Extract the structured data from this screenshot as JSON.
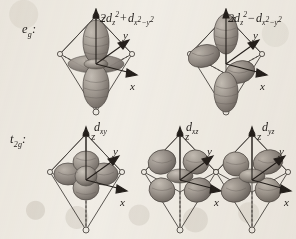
{
  "figure": {
    "background_color": "#f2efe9",
    "ink_color": "#231f1c",
    "lobe_fill": "#8e8781",
    "lobe_fill_light": "#b4aea6",
    "cage_line": "#4a4541"
  },
  "rows": [
    {
      "set_label": "e",
      "set_sub": "g",
      "set_colon": ":",
      "cells": [
        {
          "name": "2d_z2_plus_d_x2-y2",
          "formula_plain": "2dz2 + dx2-y2",
          "lead": "2d",
          "lead_sub": "z",
          "lead_sup": "2",
          "op": "+",
          "tail": "d",
          "tail_sub_a": "x",
          "tail_sup_a": "2",
          "tail_dash": "−",
          "tail_sub_b": "y",
          "tail_sup_b": "2",
          "axes": [
            "z",
            "y",
            "x"
          ],
          "orbital_kind": "dz2"
        },
        {
          "name": "2d_z2_minus_d_x2-y2",
          "formula_plain": "2dz2 - dx2-y2",
          "lead": "2d",
          "lead_sub": "z",
          "lead_sup": "2",
          "op": "−",
          "tail": "d",
          "tail_sub_a": "x",
          "tail_sup_a": "2",
          "tail_dash": "−",
          "tail_sub_b": "y",
          "tail_sup_b": "2",
          "axes": [
            "z",
            "y",
            "x"
          ],
          "orbital_kind": "dx2y2mix"
        }
      ]
    },
    {
      "set_label": "t",
      "set_sub": "2g",
      "set_colon": ":",
      "cells": [
        {
          "name": "d_xy",
          "formula_plain": "dxy",
          "lead": "d",
          "lead_sub": "xy",
          "lead_sup": "",
          "op": "",
          "tail": "",
          "axes": [
            "z",
            "y",
            "x"
          ],
          "orbital_kind": "dxy"
        },
        {
          "name": "d_xz",
          "formula_plain": "dxz",
          "lead": "d",
          "lead_sub": "xz",
          "lead_sup": "",
          "op": "",
          "tail": "",
          "axes": [
            "z",
            "y",
            "x"
          ],
          "orbital_kind": "dxz"
        },
        {
          "name": "d_yz",
          "formula_plain": "dyz",
          "lead": "d",
          "lead_sub": "yz",
          "lead_sup": "",
          "op": "",
          "tail": "",
          "axes": [
            "z",
            "y",
            "x"
          ],
          "orbital_kind": "dyz"
        }
      ]
    }
  ],
  "axis_labels": {
    "z": "z",
    "y": "y",
    "x": "x"
  }
}
